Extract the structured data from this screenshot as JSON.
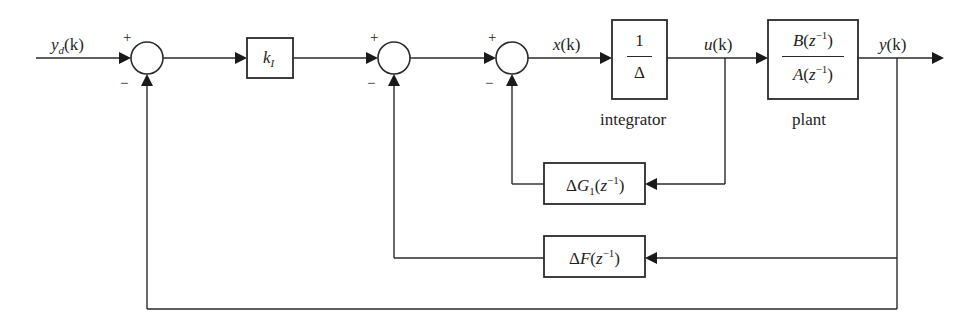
{
  "diagram": {
    "type": "control-loop-block-diagram",
    "signals": {
      "reference": "y_d(k)",
      "control_error": "x(k)",
      "control_input": "u(k)",
      "output": "y(k)"
    },
    "blocks": {
      "gain": {
        "label_main": "k",
        "label_sub": "I"
      },
      "integrator": {
        "numerator": "1",
        "denominator": "Δ",
        "caption": "integrator"
      },
      "plant": {
        "numerator": "B(z⁻¹)",
        "denominator": "A(z⁻¹)",
        "caption": "plant"
      },
      "feedback_g1": {
        "label": "ΔG₁(z⁻¹)"
      },
      "feedback_f": {
        "label": "ΔF(z⁻¹)"
      }
    },
    "summing_junctions": [
      {
        "id": "sum1",
        "plus": "+",
        "minus": "−"
      },
      {
        "id": "sum2",
        "plus": "+",
        "minus": "−"
      },
      {
        "id": "sum3",
        "plus": "+",
        "minus": "−"
      }
    ]
  },
  "text": {
    "yd_main": "y",
    "yd_sub": "d",
    "yd_arg": "(k)",
    "x_main": "x",
    "x_arg": "(k)",
    "u_main": "u",
    "u_arg": "(k)",
    "y_main": "y",
    "y_arg": "(k)",
    "k_main": "k",
    "k_sub": "I",
    "int_num": "1",
    "int_den": "Δ",
    "int_caption": "integrator",
    "plant_num_a": "B",
    "plant_num_b": "(",
    "plant_num_z": "z",
    "plant_num_sup": "−1",
    "plant_num_c": ")",
    "plant_den_a": "A",
    "plant_den_b": "(",
    "plant_den_z": "z",
    "plant_den_sup": "−1",
    "plant_den_c": ")",
    "plant_caption": "plant",
    "g1_delta": "Δ",
    "g1_G": "G",
    "g1_sub": "1",
    "g1_open": "(",
    "g1_z": "z",
    "g1_sup": "−1",
    "g1_close": ")",
    "f_delta": "Δ",
    "f_F": "F",
    "f_open": "(",
    "f_z": "z",
    "f_sup": "−1",
    "f_close": ")",
    "plus": "+",
    "minus": "−"
  }
}
